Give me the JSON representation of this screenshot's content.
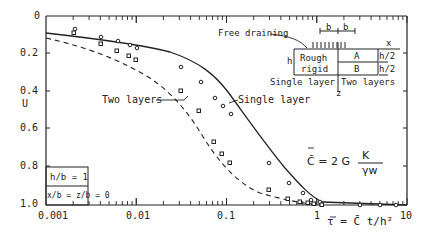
{
  "chart_data": {
    "type": "line",
    "title": "",
    "xlabel": "τ = C̄ t / h²",
    "ylabel": "U",
    "xscale": "log",
    "xlim": [
      0.001,
      10
    ],
    "ylim": [
      1.0,
      0
    ],
    "y_inverted": true,
    "x_ticks": [
      "0.001",
      "0.01",
      "0.1",
      "1",
      "10"
    ],
    "y_ticks": [
      "0",
      "0.2",
      "0.4",
      "0.6",
      "0.8",
      "1.0"
    ],
    "grid": false,
    "series": [
      {
        "name": "Single layer",
        "style": "solid, circle markers",
        "x": [
          0.002,
          0.006,
          0.012,
          0.02,
          0.027,
          0.1,
          0.17,
          0.3,
          0.5,
          0.7,
          1.0,
          2.0,
          4.0,
          6.0,
          8.0,
          9.0
        ],
        "y": [
          0.07,
          0.1,
          0.12,
          0.14,
          0.15,
          0.28,
          0.36,
          0.6,
          0.76,
          0.86,
          0.96,
          0.99,
          1.0,
          1.0,
          1.0,
          1.0
        ]
      },
      {
        "name": "Two layers",
        "style": "dashed, square markers",
        "x": [
          0.002,
          0.006,
          0.012,
          0.02,
          0.027,
          0.1,
          0.17,
          0.04,
          0.05,
          0.06,
          0.3,
          0.5,
          0.7,
          0.8,
          0.9,
          1.0
        ],
        "y": [
          0.09,
          0.13,
          0.17,
          0.2,
          0.22,
          0.41,
          0.54,
          0.65,
          0.71,
          0.79,
          0.87,
          0.91,
          0.93,
          0.95,
          0.96,
          0.98
        ]
      }
    ],
    "annotations": [
      "Free draining",
      "Rough rigid",
      "Single layer",
      "Two layers",
      "h/b = 1",
      "x/b = z/b = 0",
      "C̄ = 2 G₀ K₀ / γw"
    ]
  },
  "labels": {
    "y_axis_label": "U",
    "y_ticks": [
      "0",
      "0.2",
      "0.4",
      "0.6",
      "0.8",
      "1.0"
    ],
    "x_ticks": [
      "0.001",
      "0.01",
      "0.1",
      "1",
      "10"
    ],
    "x_axis_label": "τ = C̄ t/h²",
    "two_layers_label": "Two layers",
    "single_layer_label": "Single layer",
    "free_draining": "Free draining",
    "rough": "Rough",
    "rigid": "rigid",
    "h": "h",
    "b1": "b",
    "b2": "b",
    "x": "x",
    "z": "z",
    "A": "A",
    "B": "B",
    "h2a": "h/2",
    "h2b": "h/2",
    "inset_single": "Single layer",
    "inset_two": "Two layers",
    "hb": "h/b = 1",
    "xbzb": "x/b = z/b = 0",
    "formula_lhs": "C̄ = 2 G",
    "formula_num": "K",
    "formula_den": "γw"
  }
}
